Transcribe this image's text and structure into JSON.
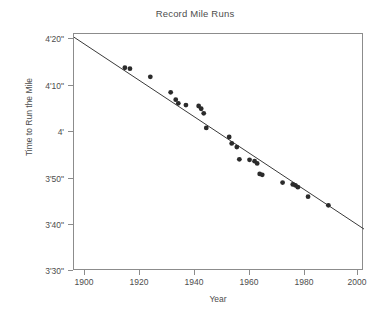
{
  "chart_data": {
    "type": "scatter",
    "title": "Record Mile Runs",
    "xlabel": "Year",
    "ylabel": "Time to Run the Mile",
    "xlim": [
      1893,
      2007
    ],
    "ylim_seconds": [
      210,
      262
    ],
    "xticks": [
      1900,
      1920,
      1940,
      1960,
      1980,
      2000
    ],
    "xticklabels": [
      "1900",
      "1920",
      "1940",
      "1960",
      "1980",
      "2000"
    ],
    "yticks_seconds": [
      210,
      220,
      230,
      240,
      250,
      260
    ],
    "yticklabels": [
      "3'30\"",
      "3'40\"",
      "3'50\"",
      "4'",
      "4'10\"",
      "4'20\""
    ],
    "grid": false,
    "legend": null,
    "series": [
      {
        "name": "World record mile times",
        "marker": "circle",
        "color": "#2b2b2b",
        "points": [
          {
            "x": 1913,
            "y": 254.6
          },
          {
            "x": 1915,
            "y": 254.4
          },
          {
            "x": 1923,
            "y": 252.6
          },
          {
            "x": 1931,
            "y": 249.2
          },
          {
            "x": 1933,
            "y": 247.6
          },
          {
            "x": 1934,
            "y": 246.8
          },
          {
            "x": 1937,
            "y": 246.4
          },
          {
            "x": 1942,
            "y": 246.2
          },
          {
            "x": 1943,
            "y": 245.6
          },
          {
            "x": 1944,
            "y": 244.6
          },
          {
            "x": 1945,
            "y": 241.4
          },
          {
            "x": 1954,
            "y": 239.4
          },
          {
            "x": 1955,
            "y": 238.0
          },
          {
            "x": 1957,
            "y": 237.2
          },
          {
            "x": 1958,
            "y": 234.5
          },
          {
            "x": 1962,
            "y": 234.4
          },
          {
            "x": 1964,
            "y": 234.1
          },
          {
            "x": 1965,
            "y": 233.6
          },
          {
            "x": 1966,
            "y": 231.3
          },
          {
            "x": 1967,
            "y": 231.1
          },
          {
            "x": 1975,
            "y": 229.4
          },
          {
            "x": 1979,
            "y": 229.0
          },
          {
            "x": 1980,
            "y": 228.8
          },
          {
            "x": 1981,
            "y": 228.4
          },
          {
            "x": 1985,
            "y": 226.3
          },
          {
            "x": 1993,
            "y": 224.4
          }
        ]
      }
    ],
    "fit_line": {
      "name": "linear trend",
      "color": "#3a3a3a",
      "x_start": 1893,
      "y_start": 261.3,
      "x_end": 2007,
      "y_end": 219.2
    }
  }
}
